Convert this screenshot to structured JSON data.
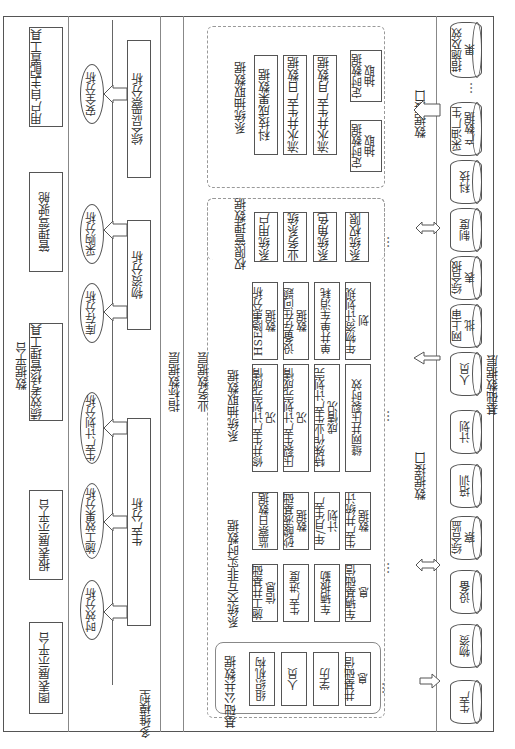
{
  "platform": {
    "title": "数据平台",
    "tools": [
      "用户自主配置工具",
      "管理驾驶舱",
      "绩效考核管理工具",
      "报表展示平台",
      "图表展示平台"
    ]
  },
  "indicator_layer": {
    "title": "指标数据层",
    "model_label": "多维模型",
    "analyses": [
      "安全分析",
      "采购分析",
      "库存分析",
      "生产计划分析",
      "施工效果分析",
      "时效分析"
    ],
    "groups": [
      "综合监察分析",
      "物资分析",
      "生产分析"
    ]
  },
  "business_layer": {
    "title": "业务数据层",
    "extract_top": {
      "title": "系统抽取数据",
      "items": [
        "科技成果数据",
        "流水井生产日数据",
        "流水井生产月数据"
      ],
      "timers": [
        "定时数据抽取",
        "定时数据抽取"
      ]
    },
    "permission": {
      "title": "权限管理数据",
      "items": [
        "系统用户",
        "业务系统",
        "系统角色",
        "系统权限",
        "…"
      ]
    },
    "extract_mid": {
      "title": "系统抽取数据",
      "col1": [
        "HSE隐患分析数据",
        "设备存在问题数据",
        "单井单车消耗",
        "年物资计划规划"
      ],
      "col2": [
        "修井生产计划完成情况",
        "压裂生产计划完成情况",
        "特殊作业生产计划完成情况",
        "缝网井压裂时效",
        "…"
      ]
    },
    "interactive": {
      "title": "系统交互非实时数据",
      "col1": [
        "监察日数据",
        "砂酸液基础数据",
        "年/月生产计划",
        "生产井统计数据"
      ],
      "col2": [
        "施工井基础信息",
        "生产进度",
        "车辆报勤",
        "车辆基础信息",
        "…"
      ]
    },
    "public": {
      "title": "基础公共数据",
      "items": [
        "组织机构",
        "人员",
        "学历",
        "井基础信息",
        "…"
      ]
    }
  },
  "base_layer": {
    "title": "基础数据层",
    "interface_label": "数据接口",
    "databases": [
      "措施及效果",
      "…",
      "采油厂生产数据",
      "科技",
      "制度",
      "综合报表",
      "网上审批",
      "人员",
      "计划",
      "培训",
      "综合监察",
      "设备",
      "物资",
      "生产"
    ]
  }
}
